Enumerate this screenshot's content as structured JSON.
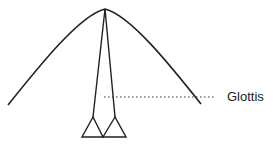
{
  "diagram": {
    "labels": {
      "glottis": "Glottis"
    },
    "colors": {
      "stroke": "#222222",
      "background": "#ffffff"
    }
  }
}
